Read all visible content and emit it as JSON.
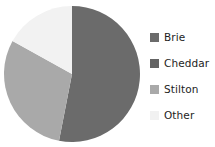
{
  "chart_data": {
    "type": "pie",
    "title": "",
    "subtitle": "",
    "xlabel": "",
    "ylabel": "",
    "grid": false,
    "legend_position": "right",
    "start_angle_deg": 0,
    "direction": "clockwise",
    "categories": [
      "Brie",
      "Cheddar",
      "Stilton",
      "Other"
    ],
    "values": [
      53,
      0,
      30,
      17
    ],
    "units": "percent",
    "colors": [
      "#6b6b6b",
      "#6b6b6b",
      "#a9a9a9",
      "#f2f2f2"
    ],
    "slices": [
      {
        "label": "Brie",
        "value": 53,
        "color": "#6b6b6b",
        "start_deg": 0,
        "end_deg": 191
      },
      {
        "label": "Cheddar",
        "value": 0,
        "color": "#6b6b6b",
        "start_deg": 191,
        "end_deg": 191
      },
      {
        "label": "Stilton",
        "value": 30,
        "color": "#a9a9a9",
        "start_deg": 191,
        "end_deg": 299
      },
      {
        "label": "Other",
        "value": 17,
        "color": "#f2f2f2",
        "start_deg": 299,
        "end_deg": 360
      }
    ]
  },
  "legend": {
    "items": [
      {
        "label": "Brie",
        "color": "#6b6b6b"
      },
      {
        "label": "Cheddar",
        "color": "#636363"
      },
      {
        "label": "Stilton",
        "color": "#a9a9a9"
      },
      {
        "label": "Other",
        "color": "#f1f1f1"
      }
    ]
  },
  "pie_geometry": {
    "center_x": 72,
    "center_y": 74,
    "radius": 68
  }
}
